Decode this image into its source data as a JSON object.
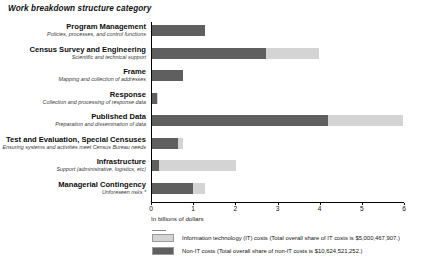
{
  "chart_data": {
    "type": "bar",
    "orientation": "horizontal",
    "stacked": true,
    "title": "Work breakdown structure category",
    "xlabel": "In billions of dollars",
    "ylabel": "",
    "xlim": [
      0,
      6
    ],
    "xticks": [
      "0",
      "1",
      "2",
      "3",
      "4",
      "5",
      "6"
    ],
    "grid": false,
    "legend_position": "bottom",
    "categories": [
      "Program Management",
      "Census Survey and Engineering",
      "Frame",
      "Response",
      "Published Data",
      "Test and Evaluation, Special Censuses",
      "Infrastructure",
      "Managerial Contingency"
    ],
    "category_descriptions": [
      "Policies, processes, and control functions",
      "Scientific and technical support",
      "Mapping and collection of addresses",
      "Collection and processing of response data",
      "Preparation and dissemination of data",
      "Ensuring systems and activities meet Census Bureau needs",
      "Support (administrative, logistics, etc)",
      "Unforeseen risks *"
    ],
    "series": [
      {
        "name": "Non-IT costs",
        "color": "#5f5f5f",
        "values": [
          1.26,
          2.7,
          0.73,
          0.11,
          4.18,
          0.62,
          0.17,
          0.97
        ]
      },
      {
        "name": "Information technology (IT) costs",
        "color": "#d4d4d4",
        "values": [
          0.0,
          1.27,
          0.0,
          0.03,
          1.78,
          0.11,
          1.83,
          0.28
        ]
      }
    ],
    "legend": [
      "Information technology (IT) costs (Total overall share of IT costs is $5,000,467,907.)",
      "Non-IT costs (Total overall share of non-IT costs is $10,624,521,252.)"
    ]
  },
  "legend_entries": [
    {
      "swatch": "it",
      "label": "Information technology (IT) costs (Total overall share of IT costs is $5,000,467,907.)"
    },
    {
      "swatch": "nonit",
      "label": "Non-IT costs (Total overall share of non-IT costs is $10,624,521,252.)"
    }
  ]
}
